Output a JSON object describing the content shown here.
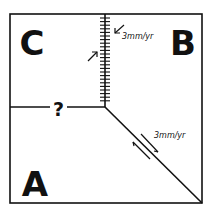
{
  "diagram": {
    "plates": [
      {
        "label": "C"
      },
      {
        "label": "B"
      },
      {
        "label": "A"
      }
    ],
    "boundaries": {
      "convergent": {
        "rate_label": "3mm/yr",
        "type": "subduction"
      },
      "transform": {
        "rate_label": "3mm/yr",
        "type": "transform"
      },
      "unknown": {
        "label": "?"
      }
    },
    "colors": {
      "line": "#111111",
      "background": "#ffffff"
    }
  }
}
